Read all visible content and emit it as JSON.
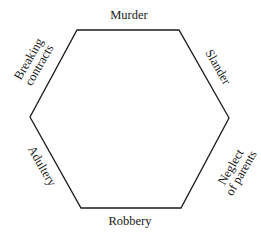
{
  "diagram": {
    "shape": "hexagon",
    "stroke_color": "#1a1a1a",
    "stroke_width": 1.3,
    "vertices": [
      [
        77,
        30
      ],
      [
        179,
        30
      ],
      [
        229,
        118
      ],
      [
        181,
        208
      ],
      [
        81,
        208
      ],
      [
        30,
        117
      ]
    ],
    "labels": {
      "top": {
        "text": "Murder",
        "x": 129,
        "y": 15,
        "rotate": 0
      },
      "top_right": {
        "text": "Slander",
        "x": 218,
        "y": 67,
        "rotate": 60
      },
      "bottom_right": {
        "line1": "Neglect",
        "line2": "of parents",
        "x": 236,
        "y": 170,
        "rotate": -60
      },
      "bottom": {
        "text": "Robbery",
        "x": 130,
        "y": 221,
        "rotate": 0
      },
      "bottom_left": {
        "text": "Adultery",
        "x": 42,
        "y": 166,
        "rotate": 60
      },
      "top_left": {
        "line1": "Breaking",
        "line2": "contracts",
        "x": 34,
        "y": 62,
        "rotate": -60
      }
    }
  }
}
